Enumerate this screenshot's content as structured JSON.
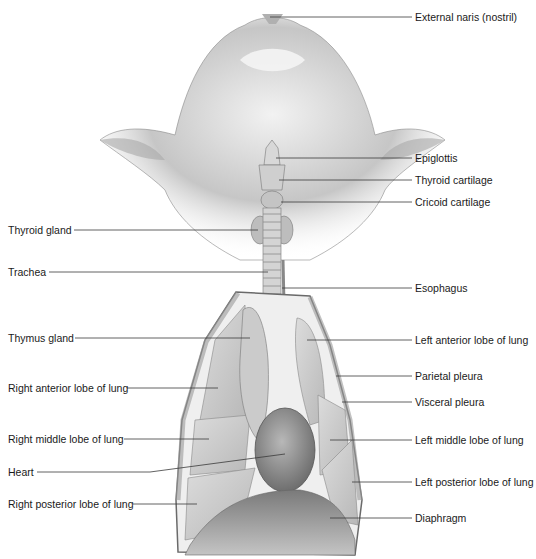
{
  "figure": {
    "colors": {
      "background": "#ffffff",
      "fur": "#9a9a9a",
      "fur_light": "#e2e2e2",
      "tissue": "#c9c9c9",
      "organ": "#a8a8a8",
      "dark": "#5a5a5a",
      "leader_line": "#3a3a3a",
      "text": "#1a1a1a"
    }
  },
  "labels": {
    "right_side": [
      {
        "id": "external-naris",
        "text": "External naris (nostril)",
        "x": 415,
        "y": 17,
        "line": [
          [
            270,
            17
          ],
          [
            412,
            17
          ]
        ]
      },
      {
        "id": "epiglottis",
        "text": "Epiglottis",
        "x": 415,
        "y": 158,
        "line": [
          [
            276,
            158
          ],
          [
            412,
            158
          ]
        ]
      },
      {
        "id": "thyroid-cartilage",
        "text": "Thyroid cartilage",
        "x": 415,
        "y": 180,
        "line": [
          [
            279,
            180
          ],
          [
            412,
            180
          ]
        ]
      },
      {
        "id": "cricoid-cartilage",
        "text": "Cricoid cartilage",
        "x": 415,
        "y": 202,
        "line": [
          [
            281,
            202
          ],
          [
            412,
            202
          ]
        ]
      },
      {
        "id": "esophagus",
        "text": "Esophagus",
        "x": 415,
        "y": 288,
        "line": [
          [
            282,
            288
          ],
          [
            412,
            288
          ]
        ]
      },
      {
        "id": "left-anterior-lobe",
        "text": "Left anterior lobe of lung",
        "x": 415,
        "y": 340,
        "line": [
          [
            307,
            340
          ],
          [
            412,
            340
          ]
        ]
      },
      {
        "id": "parietal-pleura",
        "text": "Parietal pleura",
        "x": 415,
        "y": 376,
        "line": [
          [
            336,
            376
          ],
          [
            412,
            376
          ]
        ]
      },
      {
        "id": "visceral-pleura",
        "text": "Visceral pleura",
        "x": 415,
        "y": 402,
        "line": [
          [
            342,
            402
          ],
          [
            412,
            402
          ]
        ]
      },
      {
        "id": "left-middle-lobe",
        "text": "Left middle lobe of lung",
        "x": 415,
        "y": 440,
        "line": [
          [
            330,
            440
          ],
          [
            412,
            440
          ]
        ]
      },
      {
        "id": "left-posterior-lobe",
        "text": "Left posterior lobe of lung",
        "x": 415,
        "y": 482,
        "line": [
          [
            352,
            482
          ],
          [
            412,
            482
          ]
        ]
      },
      {
        "id": "diaphragm",
        "text": "Diaphragm",
        "x": 415,
        "y": 518,
        "line": [
          [
            330,
            518
          ],
          [
            412,
            518
          ]
        ]
      }
    ],
    "left_side": [
      {
        "id": "thyroid-gland",
        "text": "Thyroid gland",
        "x": 8,
        "y": 230,
        "line": [
          [
            74,
            230
          ],
          [
            258,
            230
          ]
        ]
      },
      {
        "id": "trachea",
        "text": "Trachea",
        "x": 8,
        "y": 272,
        "line": [
          [
            49,
            272
          ],
          [
            268,
            272
          ]
        ]
      },
      {
        "id": "thymus-gland",
        "text": "Thymus gland",
        "x": 8,
        "y": 338,
        "line": [
          [
            75,
            338
          ],
          [
            250,
            338
          ]
        ]
      },
      {
        "id": "right-anterior-lobe",
        "text": "Right anterior lobe of lung",
        "x": 8,
        "y": 388,
        "line": [
          [
            127,
            388
          ],
          [
            218,
            388
          ]
        ]
      },
      {
        "id": "right-middle-lobe",
        "text": "Right middle lobe of lung",
        "x": 8,
        "y": 439,
        "line": [
          [
            124,
            439
          ],
          [
            209,
            439
          ]
        ]
      },
      {
        "id": "heart",
        "text": "Heart",
        "x": 8,
        "y": 472,
        "line": [
          [
            37,
            472
          ],
          [
            150,
            472
          ],
          [
            285,
            454
          ]
        ]
      },
      {
        "id": "right-posterior-lobe",
        "text": "Right posterior lobe of lung",
        "x": 8,
        "y": 504,
        "line": [
          [
            133,
            504
          ],
          [
            197,
            504
          ]
        ]
      }
    ]
  }
}
